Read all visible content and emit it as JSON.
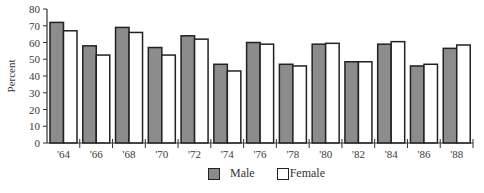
{
  "chart_data": {
    "type": "bar",
    "title": "",
    "xlabel": "",
    "ylabel": "Percent",
    "ylim": [
      0,
      80
    ],
    "yticks": [
      0,
      10,
      20,
      30,
      40,
      50,
      60,
      70,
      80
    ],
    "grid": false,
    "legend_position": "bottom",
    "categories": [
      "'64",
      "'66",
      "'68",
      "'70",
      "'72",
      "'74",
      "'76",
      "'78",
      "'80",
      "'82",
      "'84",
      "'86",
      "'88"
    ],
    "series": [
      {
        "name": "Male",
        "color": "#8c8c8c",
        "values": [
          72,
          58,
          69,
          57,
          64,
          47,
          60,
          47,
          59,
          48.5,
          59,
          46,
          56.5
        ]
      },
      {
        "name": "Female",
        "color": "#ffffff",
        "values": [
          67,
          52.5,
          66,
          52.5,
          62,
          43,
          59,
          46,
          59.5,
          48.5,
          60.5,
          47,
          58.5
        ]
      }
    ],
    "highlighted_category_color": {
      "'72": "#b03040"
    }
  },
  "legend": {
    "male_label": "Male",
    "female_label": "Female"
  }
}
